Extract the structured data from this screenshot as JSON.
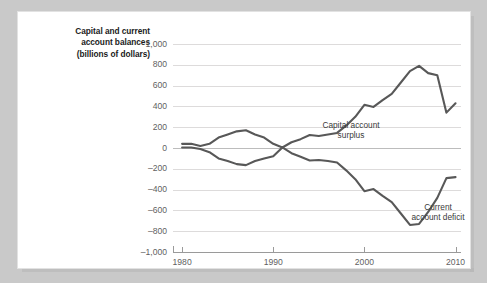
{
  "title": {
    "line1": "Capital and current",
    "line2": "account balances",
    "line3": "(billions of dollars)"
  },
  "annotations": {
    "capital": {
      "line1": "Capital account",
      "line2": "surplus"
    },
    "current": {
      "line1": "Current",
      "line2": "account deficit"
    }
  },
  "colors": {
    "page_background": "#c9c9c9",
    "card_background": "#ffffff",
    "line": "#585858",
    "gridline": "#dddbdb",
    "zeroline": "#bcbcbc",
    "axis": "#9a9a9a",
    "tick_label": "#5f5f5f",
    "title_text": "#1b1b1b"
  },
  "chart_data": {
    "type": "line",
    "title": "Capital and current account balances (billions of dollars)",
    "xlabel": "",
    "ylabel": "Capital and current account balances (billions of dollars)",
    "xlim": [
      1979,
      2010.6
    ],
    "ylim": [
      -1000,
      1000
    ],
    "grid": true,
    "legend": "annotations-inline",
    "ytick_labels": [
      "1,000",
      "800",
      "600",
      "400",
      "200",
      "0",
      "–200",
      "–400",
      "–600",
      "–800",
      "–1,000"
    ],
    "ytick_values": [
      1000,
      800,
      600,
      400,
      200,
      0,
      -200,
      -400,
      -600,
      -800,
      -1000
    ],
    "xtick_labels": [
      "1980",
      "1990",
      "2000",
      "2010"
    ],
    "xtick_values": [
      1980,
      1990,
      2000,
      2010
    ],
    "x": [
      1980,
      1981,
      1982,
      1983,
      1984,
      1985,
      1986,
      1987,
      1988,
      1989,
      1990,
      1991,
      1992,
      1993,
      1994,
      1995,
      1996,
      1997,
      1998,
      1999,
      2000,
      2001,
      2002,
      2003,
      2004,
      2005,
      2006,
      2007,
      2008,
      2009,
      2010
    ],
    "series": [
      {
        "name": "Capital account surplus",
        "annotation": "Capital account surplus",
        "color": "#585858",
        "values": [
          40,
          40,
          20,
          40,
          100,
          130,
          160,
          170,
          130,
          100,
          40,
          5,
          55,
          85,
          125,
          115,
          130,
          145,
          215,
          300,
          415,
          395,
          460,
          520,
          630,
          740,
          790,
          720,
          700,
          340,
          430
        ]
      },
      {
        "name": "Current account deficit",
        "annotation": "Current account deficit",
        "color": "#585858",
        "values": [
          5,
          5,
          -10,
          -40,
          -100,
          -125,
          -155,
          -165,
          -125,
          -100,
          -80,
          5,
          -50,
          -85,
          -120,
          -115,
          -125,
          -140,
          -215,
          -300,
          -415,
          -395,
          -460,
          -520,
          -630,
          -740,
          -730,
          -615,
          -480,
          -290,
          -280
        ]
      }
    ]
  }
}
